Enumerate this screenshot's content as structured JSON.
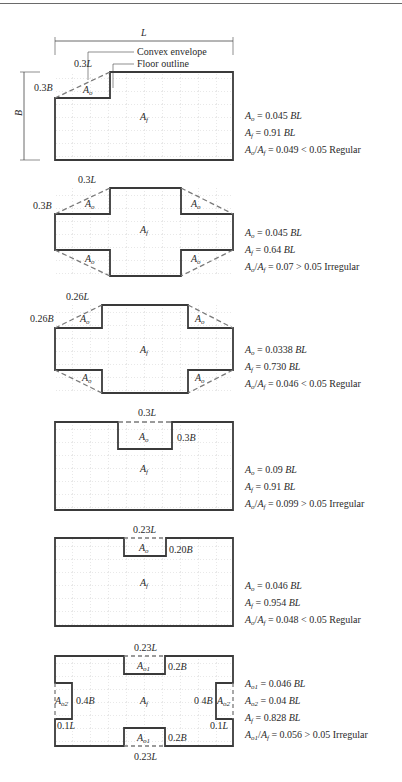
{
  "figures": [
    {
      "id": "fig1",
      "dimension_labels": {
        "top": "L",
        "side": "B",
        "notch_width": "0.3L",
        "notch_depth": "0.3B"
      },
      "legend": {
        "envelope": "Convex envelope",
        "outline": "Floor outline"
      },
      "area_labels": [
        "Ao",
        "Af"
      ],
      "equations": [
        {
          "lhs": "A",
          "lhs_sub": "o",
          "rhs_pre": "= 0.045 ",
          "rhs_it": "BL",
          "rhs_post": ""
        },
        {
          "lhs": "A",
          "lhs_sub": "f",
          "rhs_pre": "= 0.91 ",
          "rhs_it": "BL",
          "rhs_post": ""
        },
        {
          "ratio": true,
          "text": "= 0.049 < 0.05 Regular"
        }
      ],
      "verdict": "Regular"
    },
    {
      "id": "fig2",
      "dimension_labels": {
        "notch_width": "0.3L",
        "notch_depth": "0.3B"
      },
      "area_labels": [
        "Ao",
        "Ao",
        "Ao",
        "Ao",
        "Af"
      ],
      "equations": [
        {
          "lhs": "A",
          "lhs_sub": "o",
          "rhs_pre": "= 0.045 ",
          "rhs_it": "BL"
        },
        {
          "lhs": "A",
          "lhs_sub": "f",
          "rhs_pre": "= 0.64 ",
          "rhs_it": "BL"
        },
        {
          "ratio": true,
          "text": "= 0.07 > 0.05 Irregular"
        }
      ],
      "verdict": "Irregular"
    },
    {
      "id": "fig3",
      "dimension_labels": {
        "notch_width": "0.26L",
        "notch_depth": "0.26B"
      },
      "area_labels": [
        "Ao",
        "Ao",
        "Ao",
        "Ao",
        "Af"
      ],
      "equations": [
        {
          "lhs": "A",
          "lhs_sub": "o",
          "rhs_pre": "= 0.0338 ",
          "rhs_it": "BL"
        },
        {
          "lhs": "A",
          "lhs_sub": "f",
          "rhs_pre": "= 0.730 ",
          "rhs_it": "BL"
        },
        {
          "ratio": true,
          "text": "= 0.046 < 0.05 Regular"
        }
      ],
      "verdict": "Regular"
    },
    {
      "id": "fig4",
      "dimension_labels": {
        "notch_width": "0.3L",
        "notch_depth": "0.3B"
      },
      "area_labels": [
        "Ao",
        "Af"
      ],
      "equations": [
        {
          "lhs": "A",
          "lhs_sub": "o",
          "rhs_pre": "= 0.09 ",
          "rhs_it": "BL"
        },
        {
          "lhs": "A",
          "lhs_sub": "f",
          "rhs_pre": "= 0.91 ",
          "rhs_it": "BL"
        },
        {
          "ratio": true,
          "text": "= 0.099 > 0.05 Irregular"
        }
      ],
      "verdict": "Irregular"
    },
    {
      "id": "fig5",
      "dimension_labels": {
        "notch_width": "0.23L",
        "notch_depth": "0.20B"
      },
      "area_labels": [
        "Ao",
        "Af"
      ],
      "equations": [
        {
          "lhs": "A",
          "lhs_sub": "o",
          "rhs_pre": "= 0.046 ",
          "rhs_it": "BL"
        },
        {
          "lhs": "A",
          "lhs_sub": "f",
          "rhs_pre": "= 0.954 ",
          "rhs_it": "BL"
        },
        {
          "ratio": true,
          "text": "= 0.048 < 0.05 Regular"
        }
      ],
      "verdict": "Regular"
    },
    {
      "id": "fig6",
      "dimension_labels": {
        "top_notch_width": "0.23L",
        "top_notch_depth": "0.2B",
        "side_notch_height": "0.4B",
        "side_notch_depth": "0.1L",
        "bottom_notch_width": "0.23L",
        "bottom_notch_depth": "0.2B"
      },
      "area_labels": [
        "Ao1",
        "Ao1",
        "Ao2",
        "Ao2",
        "Af"
      ],
      "equations": [
        {
          "lhs": "A",
          "lhs_sub": "o1",
          "rhs_pre": "= 0.046 ",
          "rhs_it": "BL"
        },
        {
          "lhs": "A",
          "lhs_sub": "o2",
          "rhs_pre": "= 0.04 ",
          "rhs_it": "BL"
        },
        {
          "lhs": "A",
          "lhs_sub": "f",
          "rhs_pre": "= 0.828 ",
          "rhs_it": "BL"
        },
        {
          "ratio": true,
          "ratio_sub": "o1",
          "text": "= 0.056 > 0.05 Irregular"
        }
      ],
      "verdict": "Irregular"
    }
  ],
  "labels": {
    "L": "L",
    "B": "B",
    "convex_envelope": "Convex envelope",
    "floor_outline": "Floor outline",
    "A": "A",
    "o": "o",
    "f": "f",
    "o1": "o1",
    "o2": "o2",
    "f1_03L": "0.3",
    "f1_03B": "0.3",
    "f2_03L": "0.3",
    "f2_03B": "0.3",
    "f3_026L": "0.26",
    "f3_026B": "0.26",
    "f4_03L": "0.3",
    "f4_03B": "0.3",
    "f5_023L": "0.23",
    "f5_020B": "0.20",
    "f6_023L": "0.23",
    "f6_02B": "0.2",
    "f6_04B": "0.4",
    "f6_01L": "0.1",
    "f6_04B_right": "0 4",
    "slash": "/",
    "BL": "BL"
  },
  "colors": {
    "outline": "#3a3a3a",
    "envelope": "#7a7a7a",
    "grid": "#b5b5b5"
  }
}
